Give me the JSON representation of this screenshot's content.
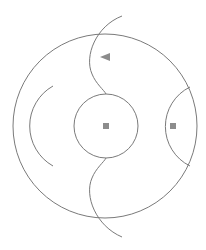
{
  "diagram": {
    "colors": {
      "background": "#ffffff",
      "stroke": "#7a7a7a",
      "marker": "#8c8c8c"
    },
    "shapes": {
      "outer_circle": {
        "cx": 105,
        "cy": 126,
        "r": 92
      },
      "inner_circle": {
        "cx": 106,
        "cy": 126,
        "r": 32
      },
      "left_arc": {
        "path": "M 53 86 A 46 46 0 0 0 53 166"
      },
      "right_arc": {
        "path": "M 190 87 A 44 44 0 0 0 190 166"
      },
      "top_curve": {
        "path": "M 122 16 C 96 26, 84 56, 92 74 C 96 84, 104 90, 106 94"
      },
      "bottom_curve": {
        "path": "M 106 158 C 104 162, 96 168, 92 178 C 84 196, 96 226, 122 237"
      }
    },
    "markers": [
      {
        "type": "triangle-left",
        "points": "100,57 110,53 110,61"
      },
      {
        "type": "square",
        "x": 103,
        "y": 123,
        "size": 6
      },
      {
        "type": "square",
        "x": 170,
        "y": 123,
        "size": 6
      }
    ]
  }
}
